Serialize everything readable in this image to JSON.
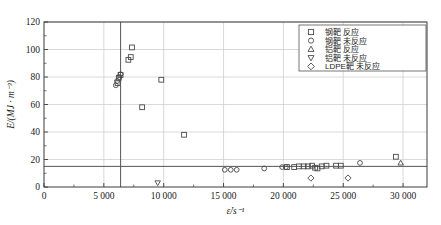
{
  "chart_data": {
    "type": "scatter",
    "title": "",
    "xlabel": "ε̇/s⁻¹",
    "ylabel": "E/(MJ · m⁻³)",
    "xlim": [
      0,
      32000
    ],
    "ylim": [
      0,
      120
    ],
    "xticks": [
      0,
      5000,
      10000,
      15000,
      20000,
      25000,
      30000
    ],
    "xtick_labels": [
      "0",
      "5 000",
      "10 000",
      "15 000",
      "20 000",
      "25 000",
      "30 000"
    ],
    "yticks": [
      0,
      20,
      40,
      60,
      80,
      100,
      120
    ],
    "ytick_labels": [
      "0",
      "20",
      "40",
      "60",
      "80",
      "100",
      "120"
    ],
    "grid": true,
    "legend_position": "top-right",
    "annotations": {
      "vertical_reference_x": 6400,
      "horizontal_reference_y": 15
    },
    "series": [
      {
        "name": "钢靶 反应",
        "marker": "square",
        "points": [
          [
            6150,
            75.5
          ],
          [
            6250,
            79.5
          ],
          [
            6400,
            81.5
          ],
          [
            7050,
            92.5
          ],
          [
            7350,
            101.5
          ],
          [
            7250,
            94.5
          ],
          [
            8200,
            58.0
          ],
          [
            9800,
            78.0
          ],
          [
            11700,
            38.0
          ],
          [
            20300,
            14.5
          ],
          [
            20900,
            14.5
          ],
          [
            21300,
            15.0
          ],
          [
            21700,
            15.0
          ],
          [
            22050,
            15.0
          ],
          [
            22400,
            15.5
          ],
          [
            22650,
            14.0
          ],
          [
            22850,
            13.5
          ],
          [
            23200,
            15.0
          ],
          [
            23600,
            15.5
          ],
          [
            24400,
            15.5
          ],
          [
            24800,
            15.5
          ],
          [
            29400,
            22.0
          ]
        ]
      },
      {
        "name": "钢靶 未反应",
        "marker": "circle",
        "points": [
          [
            6000,
            74.0
          ],
          [
            6100,
            77.0
          ],
          [
            6300,
            80.0
          ],
          [
            6400,
            82.0
          ],
          [
            15100,
            12.5
          ],
          [
            15600,
            12.5
          ],
          [
            16100,
            12.5
          ],
          [
            18400,
            13.5
          ],
          [
            19900,
            14.5
          ],
          [
            20200,
            14.5
          ],
          [
            26400,
            17.5
          ]
        ]
      },
      {
        "name": "铝靶 反应",
        "marker": "triangle-up",
        "points": [
          [
            29800,
            17.5
          ]
        ]
      },
      {
        "name": "铝靶 未反应",
        "marker": "triangle-down",
        "points": [
          [
            9500,
            3.0
          ]
        ]
      },
      {
        "name": "LDPE靶 未反应",
        "marker": "diamond",
        "points": [
          [
            22300,
            6.5
          ],
          [
            25400,
            6.5
          ]
        ]
      }
    ]
  },
  "legend": {
    "entries": [
      {
        "marker": "square",
        "label": "钢靶 反应"
      },
      {
        "marker": "circle",
        "label": "钢靶 未反应"
      },
      {
        "marker": "triangle-up",
        "label": "铝靶 反应"
      },
      {
        "marker": "triangle-down",
        "label": "铝靶 未反应"
      },
      {
        "marker": "diamond",
        "label": "LDPE靶 未反应"
      }
    ]
  },
  "colors": {
    "marker_stroke": "#4a4a4a",
    "axis": "#3a3a3a",
    "grid": "#c8c8c8",
    "reference_line": "#555555"
  }
}
